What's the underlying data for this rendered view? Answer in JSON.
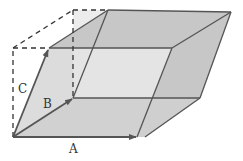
{
  "diagram": {
    "vectors": [
      {
        "name": "A",
        "label": "A"
      },
      {
        "name": "B",
        "label": "B"
      },
      {
        "name": "C",
        "label": "C"
      }
    ],
    "colors": {
      "face_dark": "#c4c4c4",
      "face_mid": "#cdcdcd",
      "face_light": "#ececec",
      "edge": "#555555",
      "dashed": "#333333"
    }
  }
}
